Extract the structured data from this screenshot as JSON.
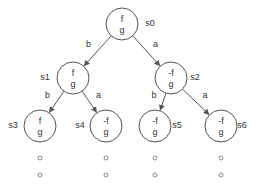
{
  "diagram": {
    "type": "computation-tree",
    "nodes": [
      {
        "id": "s0",
        "label": "s0",
        "props": [
          "f",
          "g"
        ]
      },
      {
        "id": "s1",
        "label": "s1",
        "props": [
          "f",
          "g"
        ]
      },
      {
        "id": "s2",
        "label": "s2",
        "props": [
          "-f",
          "g"
        ]
      },
      {
        "id": "s3",
        "label": "s3",
        "props": [
          "f",
          "g"
        ]
      },
      {
        "id": "s4",
        "label": "s4",
        "props": [
          "-f",
          "g"
        ]
      },
      {
        "id": "s5",
        "label": "s5",
        "props": [
          "-f",
          "g"
        ]
      },
      {
        "id": "s6",
        "label": "s6",
        "props": [
          "-f",
          "g"
        ]
      }
    ],
    "edges": [
      {
        "from": "s0",
        "to": "s1",
        "label": "b"
      },
      {
        "from": "s0",
        "to": "s2",
        "label": "a"
      },
      {
        "from": "s1",
        "to": "s3",
        "label": "b"
      },
      {
        "from": "s1",
        "to": "s4",
        "label": "a"
      },
      {
        "from": "s2",
        "to": "s5",
        "label": "b"
      },
      {
        "from": "s2",
        "to": "s6",
        "label": "a"
      }
    ],
    "continuation": {
      "symbol": "o",
      "count_per_leaf": 2,
      "leaves": [
        "s3",
        "s4",
        "s5",
        "s6"
      ]
    }
  }
}
